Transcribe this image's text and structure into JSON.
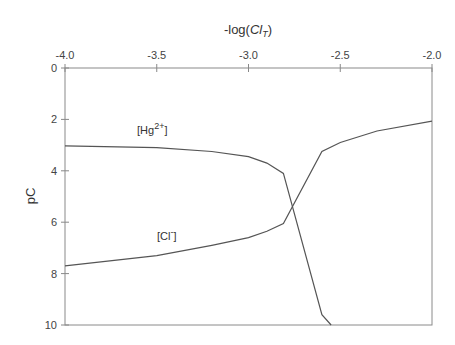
{
  "chart_data": {
    "type": "line",
    "title_parts": {
      "prefix": "-log(",
      "var": "Cl",
      "sub": "T",
      "suffix": ")"
    },
    "xlabel": "-log(Cl_T)",
    "ylabel": "pC",
    "xlim": [
      -4.0,
      -2.0
    ],
    "ylim": [
      0,
      10
    ],
    "y_inverted": true,
    "x_axis_position": "top",
    "grid": false,
    "x_ticks": [
      "-4.0",
      "-3.5",
      "-3.0",
      "-2.5",
      "-2.0"
    ],
    "y_ticks": [
      "0",
      "2",
      "4",
      "6",
      "8",
      "10"
    ],
    "series": [
      {
        "name": "[Hg2+]",
        "label_main": "[Hg",
        "label_sup": "2+",
        "label_end": "]",
        "x": [
          -4.0,
          -3.5,
          -3.2,
          -3.0,
          -2.9,
          -2.81,
          -2.6,
          -2.55
        ],
        "values": [
          3.03,
          3.1,
          3.25,
          3.45,
          3.7,
          4.1,
          9.6,
          10.0
        ]
      },
      {
        "name": "[Cl-]",
        "label_main": "[Cl",
        "label_sup": "-",
        "label_end": "]",
        "x": [
          -4.0,
          -3.5,
          -3.2,
          -3.0,
          -2.9,
          -2.81,
          -2.6,
          -2.5,
          -2.3,
          -2.0
        ],
        "values": [
          7.7,
          7.3,
          6.9,
          6.6,
          6.35,
          6.05,
          3.25,
          2.9,
          2.45,
          2.07
        ]
      }
    ],
    "colors": {
      "line": "#555555",
      "axis": "#888888"
    }
  }
}
